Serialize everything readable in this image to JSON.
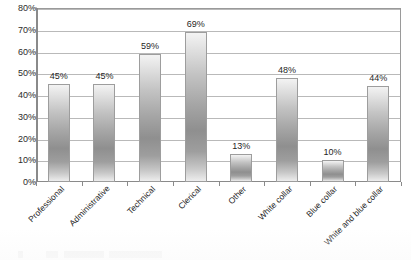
{
  "chart_data": {
    "type": "bar",
    "title": "",
    "subtitle": "",
    "xlabel": "",
    "ylabel": "",
    "categories": [
      "Professional",
      "Administrative",
      "Technical",
      "Clerical",
      "Other",
      "White collar",
      "Blue collar",
      "White and blue collar"
    ],
    "values": [
      45,
      45,
      59,
      69,
      13,
      48,
      10,
      44
    ],
    "data_labels": [
      "45%",
      "45%",
      "59%",
      "69%",
      "13%",
      "48%",
      "10%",
      "44%"
    ],
    "ylim": [
      0,
      80
    ],
    "ytick_values": [
      80,
      70,
      60,
      50,
      40,
      30,
      20,
      10,
      0
    ],
    "ytick_labels": [
      "80%",
      "70%",
      "60%",
      "50%",
      "40%",
      "30%",
      "20%",
      "10%",
      "0%"
    ],
    "grid": "horizontal",
    "legend": "none",
    "series": [
      {
        "name": "",
        "values": [
          45,
          45,
          59,
          69,
          13,
          48,
          10,
          44
        ]
      }
    ]
  },
  "style": {
    "bar_fill_light": "#ededed",
    "bar_fill_dark": "#8f8f8f",
    "bar_border": "#9d9d9d",
    "gridline_color": "#b9b9b9",
    "axis_color": "#8a8a8a",
    "text_color": "#1f1f1f",
    "plot_background": "#ffffff"
  }
}
